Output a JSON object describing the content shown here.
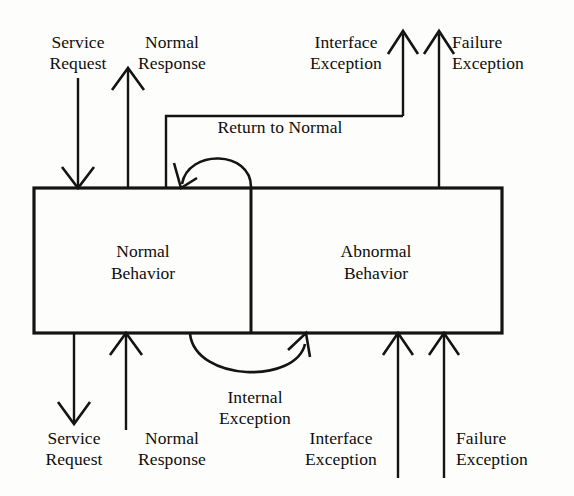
{
  "diagram": {
    "background_color": "#fdfdfb",
    "ink_color": "#141414",
    "states": [
      {
        "id": "normal",
        "line1": "Normal",
        "line2": "Behavior"
      },
      {
        "id": "abnormal",
        "line1": "Abnormal",
        "line2": "Behavior"
      }
    ],
    "labels": {
      "top_service_request": {
        "line1": "Service",
        "line2": "Request"
      },
      "top_normal_response": {
        "line1": "Normal",
        "line2": "Response"
      },
      "top_interface_exception": {
        "line1": "Interface",
        "line2": "Exception"
      },
      "top_failure_exception": {
        "line1": "Failure",
        "line2": "Exception"
      },
      "return_to_normal": {
        "line1": "Return to Normal",
        "line2": ""
      },
      "internal_exception": {
        "line1": "Internal",
        "line2": "Exception"
      },
      "bottom_service_request": {
        "line1": "Service",
        "line2": "Request"
      },
      "bottom_normal_response": {
        "line1": "Normal",
        "line2": "Response"
      },
      "bottom_interface_exception": {
        "line1": "Interface",
        "line2": "Exception"
      },
      "bottom_failure_exception": {
        "line1": "Failure",
        "line2": "Exception"
      }
    },
    "arrows": [
      {
        "name": "top-service-request-arrow",
        "direction": "down",
        "into": "normal"
      },
      {
        "name": "top-normal-response-arrow",
        "direction": "up",
        "from": "normal"
      },
      {
        "name": "top-interface-exception-arrow",
        "direction": "up",
        "from": "abnormal"
      },
      {
        "name": "top-failure-exception-arrow",
        "direction": "up",
        "from": "abnormal"
      },
      {
        "name": "return-to-normal-arc",
        "direction": "left",
        "from": "abnormal",
        "into": "normal"
      },
      {
        "name": "internal-exception-arc",
        "direction": "right",
        "from": "normal",
        "into": "abnormal"
      },
      {
        "name": "bottom-service-request-arrow",
        "direction": "down",
        "from": "normal"
      },
      {
        "name": "bottom-normal-response-arrow",
        "direction": "up",
        "into": "normal"
      },
      {
        "name": "bottom-interface-exception-arrow",
        "direction": "up",
        "into": "abnormal"
      },
      {
        "name": "bottom-failure-exception-arrow",
        "direction": "up",
        "into": "abnormal"
      }
    ]
  }
}
